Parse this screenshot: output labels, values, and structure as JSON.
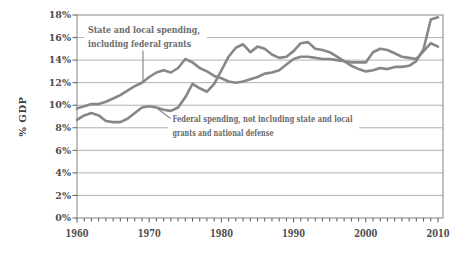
{
  "chart_data": {
    "type": "line",
    "title": "",
    "ylabel": "% GDP",
    "ylim": [
      0,
      18
    ],
    "xlim": [
      1960,
      2010
    ],
    "grid": "horizontal",
    "legend": "none (direct line annotations)",
    "line_color": "#878787",
    "y_tick_labels": [
      "0%",
      "2%",
      "4%",
      "6%",
      "8%",
      "10%",
      "12%",
      "14%",
      "16%",
      "18%"
    ],
    "x_tick_labels": [
      "1960",
      "1970",
      "1980",
      "1990",
      "2000",
      "2010"
    ],
    "x": [
      1960,
      1961,
      1962,
      1963,
      1964,
      1965,
      1966,
      1967,
      1968,
      1969,
      1970,
      1971,
      1972,
      1973,
      1974,
      1975,
      1976,
      1977,
      1978,
      1979,
      1980,
      1981,
      1982,
      1983,
      1984,
      1985,
      1986,
      1987,
      1988,
      1989,
      1990,
      1991,
      1992,
      1993,
      1994,
      1995,
      1996,
      1997,
      1998,
      1999,
      2000,
      2001,
      2002,
      2003,
      2004,
      2005,
      2006,
      2007,
      2008,
      2009,
      2010
    ],
    "series": [
      {
        "name": "state-local",
        "label": "State and local spending, including federal grants",
        "values": [
          9.7,
          9.9,
          10.1,
          10.1,
          10.3,
          10.6,
          10.9,
          11.3,
          11.7,
          12.0,
          12.5,
          12.9,
          13.1,
          12.9,
          13.3,
          14.1,
          13.8,
          13.3,
          13.0,
          12.6,
          12.4,
          12.1,
          12.0,
          12.1,
          12.3,
          12.5,
          12.8,
          12.9,
          13.1,
          13.6,
          14.1,
          14.3,
          14.3,
          14.2,
          14.1,
          14.1,
          14.0,
          13.9,
          13.8,
          13.8,
          13.8,
          14.7,
          15.0,
          14.9,
          14.6,
          14.3,
          14.2,
          14.1,
          14.8,
          15.5,
          15.2
        ]
      },
      {
        "name": "federal",
        "label": "Federal spending, not including state and local grants and national defense",
        "values": [
          8.7,
          9.1,
          9.3,
          9.1,
          8.6,
          8.5,
          8.5,
          8.8,
          9.3,
          9.8,
          9.9,
          9.8,
          9.6,
          9.5,
          9.8,
          10.7,
          11.9,
          11.5,
          11.2,
          11.9,
          13.1,
          14.3,
          15.1,
          15.4,
          14.7,
          15.2,
          15.0,
          14.5,
          14.2,
          14.3,
          14.8,
          15.5,
          15.6,
          15.0,
          14.9,
          14.7,
          14.3,
          13.9,
          13.5,
          13.2,
          13.0,
          13.1,
          13.3,
          13.2,
          13.4,
          13.4,
          13.5,
          13.9,
          15.0,
          17.6,
          17.8
        ]
      }
    ],
    "annotations": [
      {
        "target": "state-local",
        "lines": [
          "State and local spending,",
          "including federal grants"
        ]
      },
      {
        "target": "federal",
        "lines": [
          "Federal spending, not including state and local",
          "grants and national defense"
        ]
      }
    ]
  }
}
